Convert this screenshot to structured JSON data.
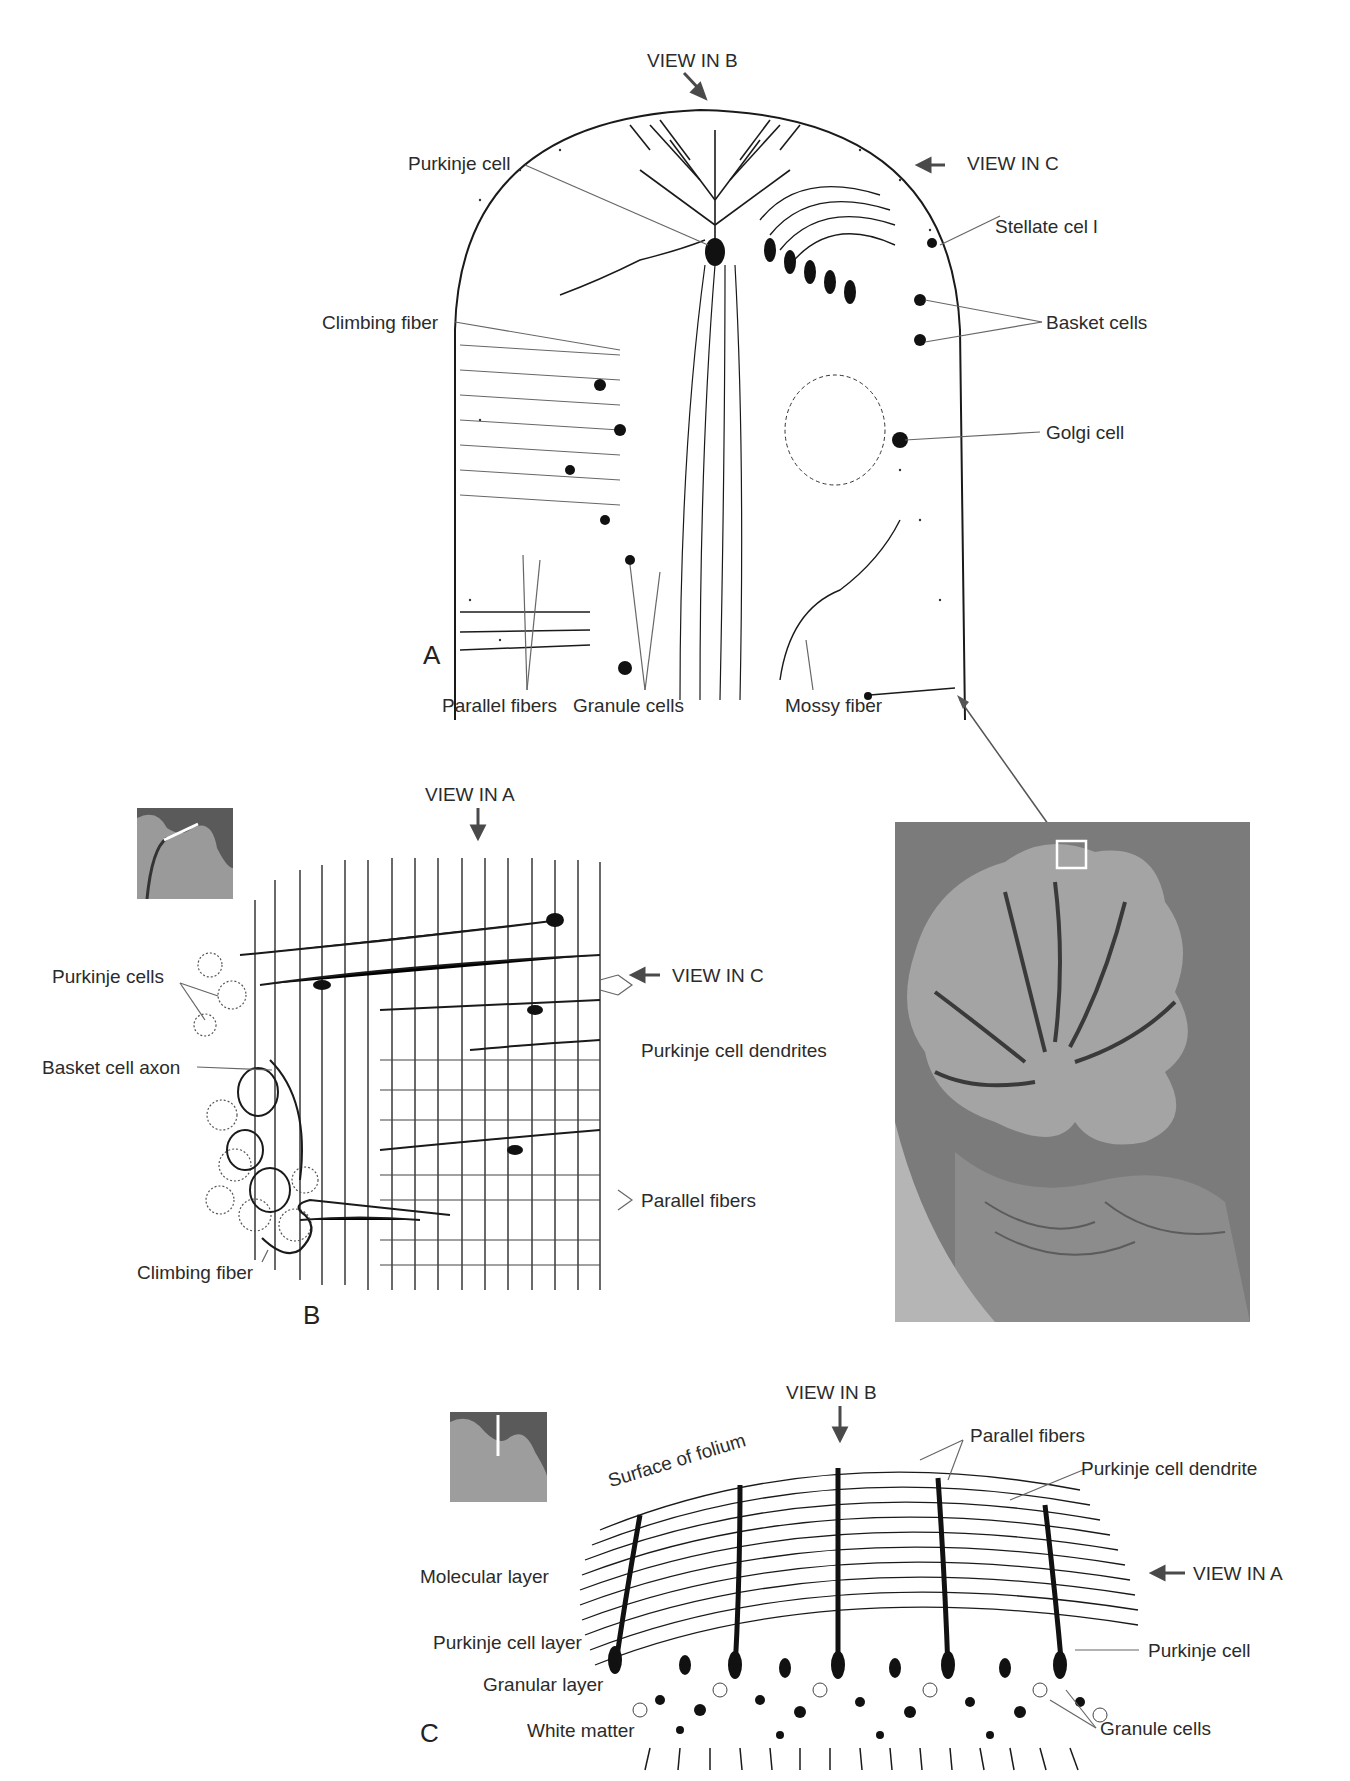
{
  "figure": {
    "colors": {
      "ink": "#1a1a1a",
      "label": "#2b2b2b",
      "leader": "#555555",
      "arrow": "#4a4a4a",
      "photo_bg": "#8a8a8a",
      "photo_dark": "#3a3a3a"
    }
  },
  "panel_a": {
    "letter": "A",
    "view_labels": {
      "top": "VIEW IN B",
      "right": "VIEW IN C"
    },
    "labels": {
      "purkinje_cell": "Purkinje cell",
      "stellate_cell": "Stellate cel l",
      "climbing_fiber": "Climbing fiber",
      "basket_cells": "Basket cells",
      "golgi_cell": "Golgi cell",
      "parallel_fibers": "Parallel fibers",
      "granule_cells": "Granule cells",
      "mossy_fiber": "Mossy fiber"
    }
  },
  "panel_b": {
    "letter": "B",
    "view_labels": {
      "top": "VIEW IN A",
      "right": "VIEW IN C"
    },
    "labels": {
      "purkinje_cells": "Purkinje cells",
      "basket_cell_axon": "Basket cell axon",
      "purkinje_cell_dendrites": "Purkinje cell dendrites",
      "parallel_fibers": "Parallel fibers",
      "climbing_fiber": "Climbing fiber"
    }
  },
  "panel_c": {
    "letter": "C",
    "view_labels": {
      "top": "VIEW IN B",
      "right": "VIEW IN A"
    },
    "labels": {
      "surface_of_folium": "Surface of folium",
      "parallel_fibers": "Parallel fibers",
      "purkinje_cell_dendrite": "Purkinje cell dendrite",
      "molecular_layer": "Molecular layer",
      "purkinje_cell_layer": "Purkinje cell layer",
      "granular_layer": "Granular layer",
      "white_matter": "White matter",
      "purkinje_cell": "Purkinje cell",
      "granule_cells": "Granule cells"
    }
  },
  "photo": {
    "description": "Sagittal section of cerebellum with boxed folium",
    "box_marker": "white square"
  }
}
